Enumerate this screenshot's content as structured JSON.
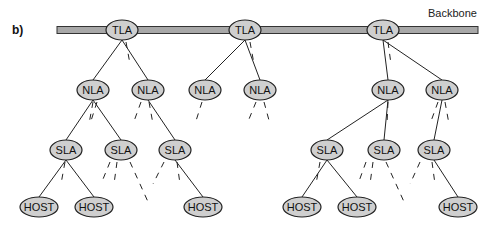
{
  "panel_label": "b)",
  "backbone": {
    "label": "Backbone",
    "x1": 57,
    "x2": 478,
    "y": 30,
    "fill": "#a8a8a8",
    "stroke": "#333333"
  },
  "style": {
    "node_fill": "#cfcfcf",
    "node_stroke": "#222222",
    "line_color": "#222222"
  },
  "nodes": [
    {
      "id": "tla1",
      "label": "TLA",
      "x": 122,
      "y": 30,
      "rx": 16,
      "ry": 10
    },
    {
      "id": "tla2",
      "label": "TLA",
      "x": 245,
      "y": 30,
      "rx": 16,
      "ry": 10
    },
    {
      "id": "tla3",
      "label": "TLA",
      "x": 383,
      "y": 30,
      "rx": 16,
      "ry": 10
    },
    {
      "id": "nla1",
      "label": "NLA",
      "x": 93,
      "y": 90,
      "rx": 16,
      "ry": 10
    },
    {
      "id": "nla2",
      "label": "NLA",
      "x": 148,
      "y": 90,
      "rx": 16,
      "ry": 10
    },
    {
      "id": "nla3",
      "label": "NLA",
      "x": 205,
      "y": 90,
      "rx": 16,
      "ry": 10
    },
    {
      "id": "nla4",
      "label": "NLA",
      "x": 260,
      "y": 90,
      "rx": 16,
      "ry": 10
    },
    {
      "id": "nla5",
      "label": "NLA",
      "x": 388,
      "y": 90,
      "rx": 16,
      "ry": 10
    },
    {
      "id": "nla6",
      "label": "NLA",
      "x": 442,
      "y": 90,
      "rx": 16,
      "ry": 10
    },
    {
      "id": "sla1",
      "label": "SLA",
      "x": 66,
      "y": 150,
      "rx": 16,
      "ry": 10
    },
    {
      "id": "sla2",
      "label": "SLA",
      "x": 121,
      "y": 150,
      "rx": 16,
      "ry": 10
    },
    {
      "id": "sla3",
      "label": "SLA",
      "x": 175,
      "y": 150,
      "rx": 16,
      "ry": 10
    },
    {
      "id": "sla4",
      "label": "SLA",
      "x": 327,
      "y": 150,
      "rx": 16,
      "ry": 10
    },
    {
      "id": "sla5",
      "label": "SLA",
      "x": 384,
      "y": 150,
      "rx": 16,
      "ry": 10
    },
    {
      "id": "sla6",
      "label": "SLA",
      "x": 434,
      "y": 150,
      "rx": 16,
      "ry": 10
    },
    {
      "id": "host1",
      "label": "HOST",
      "x": 39,
      "y": 207,
      "rx": 19,
      "ry": 10
    },
    {
      "id": "host2",
      "label": "HOST",
      "x": 94,
      "y": 207,
      "rx": 19,
      "ry": 10
    },
    {
      "id": "host3",
      "label": "HOST",
      "x": 203,
      "y": 207,
      "rx": 19,
      "ry": 10
    },
    {
      "id": "host4",
      "label": "HOST",
      "x": 302,
      "y": 207,
      "rx": 19,
      "ry": 10
    },
    {
      "id": "host5",
      "label": "HOST",
      "x": 357,
      "y": 207,
      "rx": 19,
      "ry": 10
    },
    {
      "id": "host6",
      "label": "HOST",
      "x": 458,
      "y": 207,
      "rx": 19,
      "ry": 10
    }
  ],
  "edges": [
    {
      "from": "tla1",
      "to": "nla1"
    },
    {
      "from": "tla1",
      "to": "nla2"
    },
    {
      "from": "tla2",
      "to": "nla3"
    },
    {
      "from": "tla2",
      "to": "nla4"
    },
    {
      "from": "tla3",
      "to": "nla5"
    },
    {
      "from": "tla3",
      "to": "nla6"
    },
    {
      "from": "nla1",
      "to": "sla1"
    },
    {
      "from": "nla1",
      "to": "sla2"
    },
    {
      "from": "nla2",
      "to": "sla3"
    },
    {
      "from": "nla5",
      "to": "sla4"
    },
    {
      "from": "nla5",
      "to": "sla5"
    },
    {
      "from": "nla6",
      "to": "sla6"
    },
    {
      "from": "sla1",
      "to": "host1"
    },
    {
      "from": "sla1",
      "to": "host2"
    },
    {
      "from": "sla3",
      "to": "host3"
    },
    {
      "from": "sla4",
      "to": "host4"
    },
    {
      "from": "sla4",
      "to": "host5"
    },
    {
      "from": "sla6",
      "to": "host6"
    }
  ],
  "dashed_stubs": [
    {
      "x1": 126,
      "y1": 42,
      "x2": 130,
      "y2": 64
    },
    {
      "x1": 250,
      "y1": 42,
      "x2": 254,
      "y2": 64
    },
    {
      "x1": 388,
      "y1": 42,
      "x2": 391,
      "y2": 64
    },
    {
      "x1": 93,
      "y1": 102,
      "x2": 89,
      "y2": 124
    },
    {
      "x1": 97,
      "y1": 102,
      "x2": 90,
      "y2": 124
    },
    {
      "x1": 141,
      "y1": 102,
      "x2": 133,
      "y2": 124
    },
    {
      "x1": 149,
      "y1": 102,
      "x2": 153,
      "y2": 124
    },
    {
      "x1": 202,
      "y1": 102,
      "x2": 195,
      "y2": 124
    },
    {
      "x1": 256,
      "y1": 102,
      "x2": 247,
      "y2": 124
    },
    {
      "x1": 264,
      "y1": 102,
      "x2": 270,
      "y2": 124
    },
    {
      "x1": 388,
      "y1": 102,
      "x2": 387,
      "y2": 124
    },
    {
      "x1": 438,
      "y1": 102,
      "x2": 430,
      "y2": 124
    },
    {
      "x1": 445,
      "y1": 102,
      "x2": 449,
      "y2": 124
    },
    {
      "x1": 65,
      "y1": 162,
      "x2": 61,
      "y2": 184
    },
    {
      "x1": 110,
      "y1": 162,
      "x2": 101,
      "y2": 184
    },
    {
      "x1": 117,
      "y1": 162,
      "x2": 114,
      "y2": 184
    },
    {
      "x1": 130,
      "y1": 162,
      "x2": 149,
      "y2": 204
    },
    {
      "x1": 164,
      "y1": 162,
      "x2": 153,
      "y2": 184
    },
    {
      "x1": 177,
      "y1": 162,
      "x2": 180,
      "y2": 184
    },
    {
      "x1": 320,
      "y1": 162,
      "x2": 316,
      "y2": 184
    },
    {
      "x1": 366,
      "y1": 162,
      "x2": 358,
      "y2": 184
    },
    {
      "x1": 373,
      "y1": 162,
      "x2": 370,
      "y2": 184
    },
    {
      "x1": 386,
      "y1": 162,
      "x2": 405,
      "y2": 204
    },
    {
      "x1": 420,
      "y1": 162,
      "x2": 410,
      "y2": 184
    },
    {
      "x1": 432,
      "y1": 162,
      "x2": 435,
      "y2": 184
    }
  ]
}
